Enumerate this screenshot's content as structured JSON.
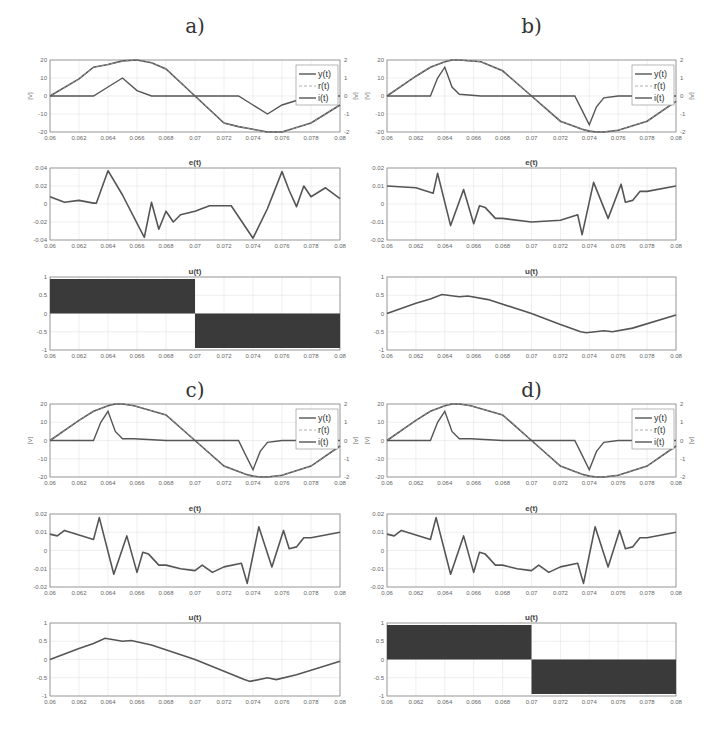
{
  "figure": {
    "panels": [
      {
        "label": "a)",
        "id": "a",
        "u_type": "switching"
      },
      {
        "label": "b)",
        "id": "b",
        "u_type": "smooth"
      },
      {
        "label": "c)",
        "id": "c",
        "u_type": "smooth"
      },
      {
        "label": "d)",
        "id": "d",
        "u_type": "switching"
      }
    ],
    "subplot_titles": {
      "top": "",
      "error": "e(t)",
      "control": "u(t)"
    },
    "top_axis": {
      "left_ylabel": "[V]",
      "right_ylabel": "[A]",
      "left_yticks": [
        "20",
        "10",
        "0",
        "-10",
        "-20"
      ],
      "right_yticks": [
        "2",
        "1",
        "0",
        "-1",
        "-2"
      ]
    },
    "error_yticks_a": [
      "0.04",
      "0.02",
      "0",
      "-0.02",
      "-0.04"
    ],
    "error_yticks_bcd": [
      "0.02",
      "0.01",
      "0",
      "-0.01",
      "-0.02"
    ],
    "control_yticks": [
      "1",
      "0.5",
      "0",
      "-0.5",
      "-1"
    ],
    "xticks": [
      "0.06",
      "0.062",
      "0.064",
      "0.066",
      "0.068",
      "0.07",
      "0.072",
      "0.074",
      "0.076",
      "0.078",
      "0.08"
    ],
    "legend": [
      "y(t)",
      "r(t)",
      "i(t)"
    ],
    "colors": {
      "line": "#555555",
      "axis": "#888888",
      "grid": "#dddddd",
      "fill": "#3a3a3a"
    }
  },
  "chart_data": [
    {
      "panel": "a",
      "type": "line",
      "title": "y(t), r(t), i(t)",
      "xlabel": "",
      "ylabel": "[V]",
      "ylabel_right": "[A]",
      "xlim": [
        0.06,
        0.08
      ],
      "ylim": [
        -20,
        20
      ],
      "ylim_right": [
        -2,
        2
      ],
      "grid": true,
      "legend_position": "upper right",
      "x": [
        0.06,
        0.062,
        0.063,
        0.064,
        0.065,
        0.066,
        0.067,
        0.068,
        0.07,
        0.072,
        0.073,
        0.074,
        0.075,
        0.076,
        0.078,
        0.08
      ],
      "series": [
        {
          "name": "y(t)",
          "values": [
            0,
            9.5,
            16,
            17.5,
            19.5,
            20,
            18.5,
            15,
            0,
            -15,
            -17,
            -18.5,
            -20,
            -20,
            -15,
            -5
          ]
        },
        {
          "name": "r(t)",
          "values": [
            0,
            9.5,
            16,
            17.5,
            19.5,
            20,
            18.5,
            15,
            0,
            -15,
            -17,
            -18.5,
            -20,
            -20,
            -15,
            -5
          ]
        },
        {
          "name": "i(t)",
          "values": [
            0,
            0,
            0,
            0.5,
            1,
            0.3,
            0,
            0,
            0,
            0,
            0,
            -0.5,
            -1,
            -0.5,
            0,
            0
          ]
        }
      ]
    },
    {
      "panel": "a",
      "type": "line",
      "title": "e(t)",
      "xlim": [
        0.06,
        0.08
      ],
      "ylim": [
        -0.04,
        0.04
      ],
      "grid": true,
      "x": [
        0.06,
        0.061,
        0.062,
        0.063,
        0.0632,
        0.064,
        0.065,
        0.0665,
        0.067,
        0.0675,
        0.068,
        0.0685,
        0.069,
        0.07,
        0.071,
        0.0725,
        0.074,
        0.075,
        0.076,
        0.0765,
        0.077,
        0.0775,
        0.078,
        0.079,
        0.08
      ],
      "series": [
        {
          "name": "e(t)",
          "values": [
            0.008,
            0.002,
            0.004,
            0.001,
            0.001,
            0.037,
            0.01,
            -0.037,
            0.002,
            -0.028,
            -0.008,
            -0.02,
            -0.012,
            -0.008,
            -0.002,
            -0.002,
            -0.038,
            -0.005,
            0.036,
            0.015,
            -0.003,
            0.02,
            0.008,
            0.018,
            0.006
          ]
        }
      ]
    },
    {
      "panel": "a",
      "type": "area",
      "title": "u(t)",
      "xlim": [
        0.06,
        0.08
      ],
      "ylim": [
        -1,
        1
      ],
      "grid": true,
      "x": [
        0.06,
        0.07,
        0.07,
        0.08
      ],
      "series": [
        {
          "name": "u(t) (high-frequency switching envelope)",
          "upper": [
            1,
            1,
            0,
            0
          ],
          "lower": [
            0,
            0,
            -1,
            -1
          ]
        }
      ]
    },
    {
      "panel": "b",
      "type": "line",
      "title": "y(t), r(t), i(t)",
      "xlim": [
        0.06,
        0.08
      ],
      "ylim": [
        -20,
        20
      ],
      "ylim_right": [
        -2,
        2
      ],
      "grid": true,
      "x": [
        0.06,
        0.062,
        0.063,
        0.0635,
        0.064,
        0.0645,
        0.065,
        0.0665,
        0.068,
        0.07,
        0.072,
        0.073,
        0.0735,
        0.074,
        0.0745,
        0.075,
        0.076,
        0.078,
        0.08
      ],
      "series": [
        {
          "name": "y(t)",
          "values": [
            0,
            11,
            16,
            17.5,
            19,
            20,
            20,
            19,
            14,
            0,
            -14,
            -17,
            -18.5,
            -19.5,
            -20,
            -20,
            -19,
            -14,
            -3
          ]
        },
        {
          "name": "r(t)",
          "values": [
            0,
            11,
            16,
            17.5,
            19,
            20,
            20,
            19,
            14,
            0,
            -14,
            -17,
            -18.5,
            -19.5,
            -20,
            -20,
            -19,
            -14,
            -3
          ]
        },
        {
          "name": "i(t)",
          "values": [
            0,
            0,
            0,
            1,
            1.6,
            0.5,
            0.1,
            0,
            0,
            0,
            0,
            0,
            -0.8,
            -1.6,
            -0.6,
            -0.1,
            0,
            0,
            0
          ]
        }
      ]
    },
    {
      "panel": "b",
      "type": "line",
      "title": "e(t)",
      "xlim": [
        0.06,
        0.08
      ],
      "ylim": [
        -0.02,
        0.02
      ],
      "grid": true,
      "x": [
        0.06,
        0.062,
        0.0632,
        0.0635,
        0.0644,
        0.0653,
        0.066,
        0.0664,
        0.0668,
        0.0675,
        0.068,
        0.07,
        0.072,
        0.0732,
        0.0735,
        0.0743,
        0.0753,
        0.0762,
        0.0765,
        0.077,
        0.0775,
        0.078,
        0.08
      ],
      "series": [
        {
          "name": "e(t)",
          "values": [
            0.01,
            0.009,
            0.006,
            0.017,
            -0.012,
            0.008,
            -0.011,
            -0.001,
            -0.002,
            -0.008,
            -0.008,
            -0.01,
            -0.009,
            -0.006,
            -0.017,
            0.012,
            -0.008,
            0.011,
            0.001,
            0.002,
            0.007,
            0.007,
            0.01
          ]
        }
      ]
    },
    {
      "panel": "b",
      "type": "line",
      "title": "u(t)",
      "xlim": [
        0.06,
        0.08
      ],
      "ylim": [
        -1,
        1
      ],
      "grid": true,
      "x": [
        0.06,
        0.062,
        0.063,
        0.0638,
        0.065,
        0.0656,
        0.067,
        0.07,
        0.072,
        0.0734,
        0.0738,
        0.075,
        0.0756,
        0.077,
        0.08
      ],
      "series": [
        {
          "name": "u(t)",
          "values": [
            0,
            0.28,
            0.4,
            0.52,
            0.46,
            0.48,
            0.38,
            0,
            -0.3,
            -0.5,
            -0.53,
            -0.47,
            -0.5,
            -0.4,
            -0.04
          ]
        }
      ]
    },
    {
      "panel": "c",
      "type": "line",
      "title": "y(t), r(t), i(t)",
      "xlim": [
        0.06,
        0.08
      ],
      "ylim": [
        -20,
        20
      ],
      "ylim_right": [
        -2,
        2
      ],
      "grid": true,
      "x": [
        0.06,
        0.062,
        0.063,
        0.0635,
        0.064,
        0.0645,
        0.065,
        0.0658,
        0.068,
        0.07,
        0.072,
        0.073,
        0.0735,
        0.074,
        0.0745,
        0.075,
        0.076,
        0.078,
        0.08
      ],
      "series": [
        {
          "name": "y(t)",
          "values": [
            0,
            11,
            16,
            17.5,
            19,
            20,
            20,
            19,
            14,
            0,
            -14,
            -17,
            -18.5,
            -19.5,
            -20,
            -20,
            -19,
            -14,
            -3
          ]
        },
        {
          "name": "r(t)",
          "values": [
            0,
            11,
            16,
            17.5,
            19,
            20,
            20,
            19,
            14,
            0,
            -14,
            -17,
            -18.5,
            -19.5,
            -20,
            -20,
            -19,
            -14,
            -3
          ]
        },
        {
          "name": "i(t)",
          "values": [
            0,
            0,
            0,
            1,
            1.6,
            0.5,
            0.1,
            0.1,
            0,
            0,
            0,
            0,
            -0.8,
            -1.6,
            -0.6,
            -0.1,
            0,
            0,
            0
          ]
        }
      ]
    },
    {
      "panel": "c",
      "type": "line",
      "title": "e(t)",
      "xlim": [
        0.06,
        0.08
      ],
      "ylim": [
        -0.02,
        0.02
      ],
      "grid": true,
      "x": [
        0.06,
        0.0605,
        0.061,
        0.063,
        0.0634,
        0.0644,
        0.0653,
        0.066,
        0.0664,
        0.0668,
        0.0675,
        0.068,
        0.069,
        0.07,
        0.0705,
        0.0712,
        0.072,
        0.0732,
        0.0736,
        0.0744,
        0.0753,
        0.0761,
        0.0765,
        0.077,
        0.0775,
        0.078,
        0.08
      ],
      "series": [
        {
          "name": "e(t)",
          "values": [
            0.009,
            0.008,
            0.011,
            0.006,
            0.018,
            -0.013,
            0.008,
            -0.012,
            -0.001,
            -0.002,
            -0.008,
            -0.008,
            -0.01,
            -0.011,
            -0.008,
            -0.012,
            -0.009,
            -0.007,
            -0.018,
            0.013,
            -0.009,
            0.011,
            0.001,
            0.002,
            0.007,
            0.007,
            0.01
          ]
        }
      ]
    },
    {
      "panel": "c",
      "type": "line",
      "title": "u(t)",
      "xlim": [
        0.06,
        0.08
      ],
      "ylim": [
        -1,
        1
      ],
      "grid": true,
      "x": [
        0.06,
        0.062,
        0.063,
        0.0638,
        0.065,
        0.0656,
        0.067,
        0.07,
        0.072,
        0.0734,
        0.0738,
        0.075,
        0.0756,
        0.077,
        0.08
      ],
      "series": [
        {
          "name": "u(t)",
          "values": [
            0,
            0.3,
            0.44,
            0.58,
            0.5,
            0.52,
            0.4,
            0,
            -0.32,
            -0.55,
            -0.6,
            -0.5,
            -0.55,
            -0.42,
            -0.05
          ]
        }
      ]
    },
    {
      "panel": "d",
      "type": "line",
      "title": "y(t), r(t), i(t)",
      "xlim": [
        0.06,
        0.08
      ],
      "ylim": [
        -20,
        20
      ],
      "ylim_right": [
        -2,
        2
      ],
      "grid": true,
      "x": [
        0.06,
        0.062,
        0.063,
        0.0635,
        0.064,
        0.0645,
        0.065,
        0.0658,
        0.068,
        0.07,
        0.072,
        0.073,
        0.0735,
        0.074,
        0.0745,
        0.075,
        0.076,
        0.078,
        0.08
      ],
      "series": [
        {
          "name": "y(t)",
          "values": [
            0,
            11,
            16,
            17.5,
            19,
            20,
            20,
            19,
            14,
            0,
            -14,
            -17,
            -18.5,
            -19.5,
            -20,
            -20,
            -19,
            -14,
            -3
          ]
        },
        {
          "name": "r(t)",
          "values": [
            0,
            11,
            16,
            17.5,
            19,
            20,
            20,
            19,
            14,
            0,
            -14,
            -17,
            -18.5,
            -19.5,
            -20,
            -20,
            -19,
            -14,
            -3
          ]
        },
        {
          "name": "i(t)",
          "values": [
            0,
            0,
            0,
            1,
            1.6,
            0.5,
            0.1,
            0.1,
            0,
            0,
            0,
            0,
            -0.8,
            -1.6,
            -0.6,
            -0.1,
            0,
            0,
            0
          ]
        }
      ]
    },
    {
      "panel": "d",
      "type": "line",
      "title": "e(t)",
      "xlim": [
        0.06,
        0.08
      ],
      "ylim": [
        -0.02,
        0.02
      ],
      "grid": true,
      "x": [
        0.06,
        0.0605,
        0.061,
        0.063,
        0.0634,
        0.0644,
        0.0653,
        0.066,
        0.0664,
        0.0668,
        0.0675,
        0.068,
        0.069,
        0.07,
        0.0705,
        0.0712,
        0.072,
        0.0732,
        0.0736,
        0.0744,
        0.0753,
        0.0761,
        0.0765,
        0.077,
        0.0775,
        0.078,
        0.08
      ],
      "series": [
        {
          "name": "e(t)",
          "values": [
            0.009,
            0.008,
            0.011,
            0.006,
            0.018,
            -0.013,
            0.008,
            -0.012,
            -0.001,
            -0.002,
            -0.008,
            -0.008,
            -0.01,
            -0.011,
            -0.008,
            -0.012,
            -0.009,
            -0.007,
            -0.018,
            0.013,
            -0.009,
            0.011,
            0.001,
            0.002,
            0.007,
            0.007,
            0.01
          ]
        }
      ]
    },
    {
      "panel": "d",
      "type": "area",
      "title": "u(t)",
      "xlim": [
        0.06,
        0.08
      ],
      "ylim": [
        -1,
        1
      ],
      "grid": true,
      "x": [
        0.06,
        0.07,
        0.07,
        0.08
      ],
      "series": [
        {
          "name": "u(t) (high-frequency switching envelope)",
          "upper": [
            1,
            1,
            0,
            0
          ],
          "lower": [
            0,
            0,
            -1,
            -1
          ]
        }
      ]
    }
  ]
}
